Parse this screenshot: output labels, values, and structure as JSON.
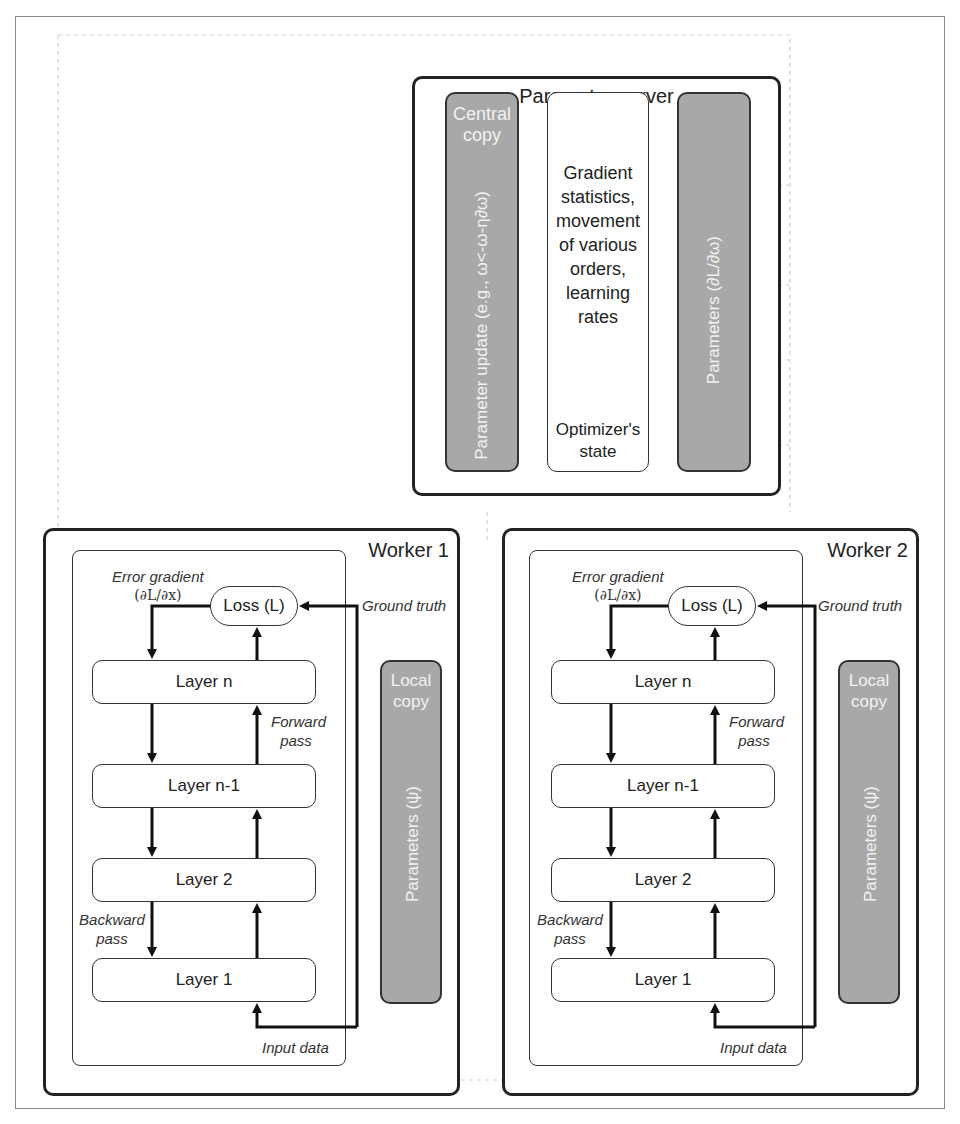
{
  "parameter_server": {
    "title": "Parameter server",
    "central_copy_label": "Central copy",
    "parameter_update_label": "Parameter update (e.g., ω<-ω-η∂ω)",
    "optimizer_state_desc": "Gradient statistics, movement of various orders, learning rates",
    "optimizer_state_label": "Optimizer's state",
    "parameters_label": "Parameters (∂L/∂ω)"
  },
  "workers": [
    {
      "title": "Worker 1",
      "error_gradient_label": "Error gradient",
      "error_gradient_formula": "(∂L/∂x)",
      "loss_label": "Loss (L)",
      "ground_truth_label": "Ground truth",
      "forward_pass_label": "Forward pass",
      "backward_pass_label": "Backward pass",
      "input_data_label": "Input data",
      "layers": [
        "Layer n",
        "Layer n-1",
        "Layer 2",
        "Layer 1"
      ],
      "local_copy_label": "Local copy",
      "local_params_label": "Parameters (ψ)"
    },
    {
      "title": "Worker 2",
      "error_gradient_label": "Error gradient",
      "error_gradient_formula": "(∂L/∂x)",
      "loss_label": "Loss (L)",
      "ground_truth_label": "Ground truth",
      "forward_pass_label": "Forward pass",
      "backward_pass_label": "Backward pass",
      "input_data_label": "Input data",
      "layers": [
        "Layer n",
        "Layer n-1",
        "Layer 2",
        "Layer 1"
      ],
      "local_copy_label": "Local copy",
      "local_params_label": "Parameters (ψ)"
    }
  ],
  "colors": {
    "box_fill": "#a8a8a8",
    "stroke": "#222222",
    "dotted": "#c8c8c8"
  }
}
